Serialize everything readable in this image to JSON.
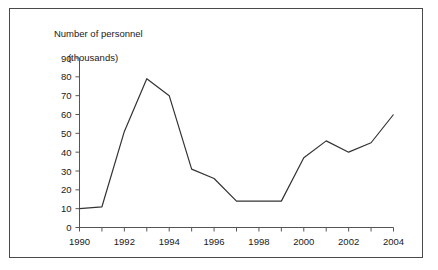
{
  "chart_data": {
    "type": "line",
    "title": "",
    "ylabel": "Number of personnel (thousands)",
    "ylabel_lines": [
      "Number of personnel",
      "(thousands)"
    ],
    "xlabel": "",
    "x": [
      1990,
      1991,
      1992,
      1993,
      1994,
      1995,
      1996,
      1997,
      1998,
      1999,
      2000,
      2001,
      2002,
      2003,
      2004
    ],
    "values": [
      10,
      11,
      51,
      79,
      70,
      31,
      26,
      14,
      14,
      14,
      37,
      46,
      40,
      45,
      60
    ],
    "series": [
      {
        "name": "Number of personnel",
        "values": [
          10,
          11,
          51,
          79,
          70,
          31,
          26,
          14,
          14,
          14,
          37,
          46,
          40,
          45,
          60
        ]
      }
    ],
    "ylim": [
      0,
      90
    ],
    "xlim": [
      1990,
      2004
    ],
    "yticks": [
      0,
      10,
      20,
      30,
      40,
      50,
      60,
      70,
      80,
      90
    ],
    "ytick_labels": [
      "0",
      "10",
      "20",
      "30",
      "40",
      "50",
      "60",
      "70",
      "80",
      "90"
    ],
    "xticks": [
      1990,
      1991,
      1992,
      1993,
      1994,
      1995,
      1996,
      1997,
      1998,
      1999,
      2000,
      2001,
      2002,
      2003,
      2004
    ],
    "xtick_labels": [
      "1990",
      "",
      "1992",
      "",
      "1994",
      "",
      "1996",
      "",
      "1998",
      "",
      "2000",
      "",
      "2002",
      "",
      "2004"
    ],
    "xtick_labels_shown": [
      "1990",
      "1992",
      "1994",
      "1996",
      "1998",
      "2000",
      "2002",
      "2004"
    ],
    "grid": false,
    "legend": null,
    "legend_position": "none",
    "line_color": "#333333",
    "axis_color": "#555555",
    "background_color": "#ffffff",
    "border_color": "#4a4a4a"
  }
}
